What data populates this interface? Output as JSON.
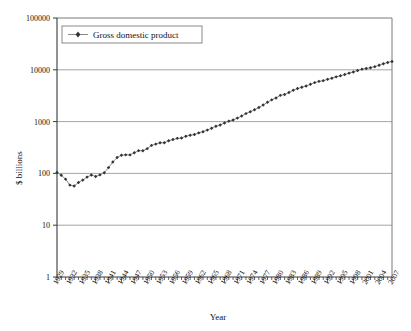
{
  "chart_data": {
    "type": "line",
    "title": "",
    "xlabel": "Year",
    "ylabel": "$ billions",
    "yscale": "log",
    "ylim": [
      1,
      100000
    ],
    "ytick_labels": [
      "1",
      "10",
      "100",
      "1000",
      "10000",
      "100000"
    ],
    "ytick_values": [
      1,
      10,
      100,
      1000,
      10000,
      100000
    ],
    "xlim": [
      1929,
      2007
    ],
    "xtick_labels": [
      "1929",
      "1932",
      "1935",
      "1938",
      "1941",
      "1944",
      "1947",
      "1950",
      "1953",
      "1956",
      "1959",
      "1962",
      "1965",
      "1968",
      "1971",
      "1974",
      "1977",
      "1980",
      "1983",
      "1986",
      "1989",
      "1992",
      "1995",
      "1998",
      "2001",
      "2004",
      "2007"
    ],
    "grid": true,
    "legend_position": "top-left-inside",
    "legend": [
      "Gross domestic product"
    ],
    "marker": "diamond",
    "line_color": "#8a8a8a",
    "marker_color": "#333333",
    "series": [
      {
        "name": "Gross domestic product",
        "x": [
          1929,
          1930,
          1931,
          1932,
          1933,
          1934,
          1935,
          1936,
          1937,
          1938,
          1939,
          1940,
          1941,
          1942,
          1943,
          1944,
          1945,
          1946,
          1947,
          1948,
          1949,
          1950,
          1951,
          1952,
          1953,
          1954,
          1955,
          1956,
          1957,
          1958,
          1959,
          1960,
          1961,
          1962,
          1963,
          1964,
          1965,
          1966,
          1967,
          1968,
          1969,
          1970,
          1971,
          1972,
          1973,
          1974,
          1975,
          1976,
          1977,
          1978,
          1979,
          1980,
          1981,
          1982,
          1983,
          1984,
          1985,
          1986,
          1987,
          1988,
          1989,
          1990,
          1991,
          1992,
          1993,
          1994,
          1995,
          1996,
          1997,
          1998,
          1999,
          2000,
          2001,
          2002,
          2003,
          2004,
          2005,
          2006,
          2007
        ],
        "values": [
          104.6,
          92.2,
          77.4,
          59.5,
          57.2,
          66.8,
          74.3,
          84.9,
          93.0,
          87.4,
          93.5,
          102.9,
          129.4,
          166.0,
          203.1,
          224.6,
          228.2,
          227.8,
          249.9,
          274.8,
          272.8,
          300.2,
          347.3,
          367.7,
          389.7,
          391.1,
          426.2,
          450.1,
          474.9,
          482.0,
          522.5,
          543.3,
          563.3,
          605.1,
          638.6,
          685.8,
          743.7,
          815.0,
          861.7,
          942.5,
          1019.9,
          1075.9,
          1167.8,
          1282.4,
          1428.5,
          1548.8,
          1688.9,
          1877.6,
          2086.0,
          2356.6,
          2632.1,
          2862.5,
          3211.0,
          3345.0,
          3638.1,
          4040.7,
          4346.7,
          4590.2,
          4870.2,
          5252.6,
          5657.7,
          5979.6,
          6174.0,
          6539.3,
          6878.7,
          7308.8,
          7664.1,
          8100.2,
          8608.5,
          9089.2,
          9665.7,
          10289.7,
          10625.3,
          10980.2,
          11512.2,
          12277.0,
          13095.4,
          13857.9,
          14480.3
        ]
      }
    ]
  }
}
